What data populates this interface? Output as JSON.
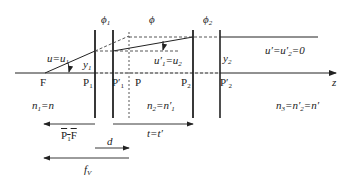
{
  "planes": {
    "phi1": "ϕ",
    "phi1_sub": "1",
    "phi": "ϕ",
    "phi2": "ϕ",
    "phi2_sub": "2"
  },
  "points": {
    "F": "F",
    "P1": "P",
    "P1_sub": "1",
    "P1p": "P′",
    "P1p_sub": "1",
    "P": "P",
    "P2": "P",
    "P2_sub": "2",
    "P2p": "P′",
    "P2p_sub": "2"
  },
  "angles": {
    "u_eq_u1": "u=u",
    "u_eq_u1_sub": "1",
    "u1p_eq_u2": "u′",
    "u1p_eq_u2_sub1": "1",
    "u1p_eq_u2_mid": "=u",
    "u1p_eq_u2_sub2": "2",
    "up_eq_u2p": "u′=u′",
    "up_eq_u2p_sub": "2",
    "up_eq_u2p_end": "=0"
  },
  "heights": {
    "y1": "y",
    "y1_sub": "1",
    "y2": "y",
    "y2_sub": "2"
  },
  "indices": {
    "n1": "n",
    "n1_sub": "1",
    "n1_end": "=n",
    "n2": "n",
    "n2_sub": "2",
    "n2_mid": "=n′",
    "n2_sub2": "1",
    "n3": "n",
    "n3_sub": "3",
    "n3_mid": "=n′",
    "n3_sub2": "2",
    "n3_end": "=n′"
  },
  "distances": {
    "P1F": "P",
    "P1F_sub": "1",
    "P1F_end": "F",
    "d": "d",
    "t": "t=t′",
    "fv": "f",
    "fv_sub": "V"
  },
  "axis": {
    "label": "z"
  }
}
